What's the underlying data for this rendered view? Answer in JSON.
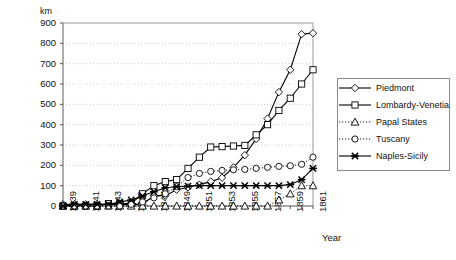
{
  "chart_data": {
    "type": "line",
    "title": "",
    "xlabel": "Year",
    "ylabel": "km",
    "ylim": [
      0,
      900
    ],
    "ytick_step": 100,
    "yticks": [
      "900",
      "800",
      "700",
      "600",
      "500",
      "400",
      "300",
      "200",
      "100",
      "0"
    ],
    "grid": true,
    "legend_position": "right-middle",
    "x": [
      1839,
      1840,
      1841,
      1842,
      1843,
      1844,
      1845,
      1846,
      1847,
      1848,
      1849,
      1850,
      1851,
      1852,
      1853,
      1854,
      1855,
      1856,
      1857,
      1858,
      1859,
      1860,
      1861
    ],
    "xtick_labels": [
      "1839",
      "1841",
      "1843",
      "1845",
      "1847",
      "1849",
      "1851",
      "1853",
      "1855",
      "1857",
      "1859",
      "1861"
    ],
    "series": [
      {
        "name": "Piedmont",
        "marker": "diamond",
        "linestyle": "solid",
        "values": [
          8,
          8,
          8,
          8,
          8,
          8,
          8,
          8,
          51,
          51,
          80,
          92,
          105,
          120,
          139,
          190,
          250,
          330,
          430,
          560,
          670,
          845,
          850
        ]
      },
      {
        "name": "Lombardy-Venetia",
        "marker": "square",
        "linestyle": "solid",
        "values": [
          0,
          0,
          0,
          0,
          12,
          12,
          12,
          60,
          100,
          120,
          130,
          185,
          240,
          290,
          292,
          295,
          298,
          350,
          400,
          470,
          530,
          600,
          670
        ]
      },
      {
        "name": "Papal States",
        "marker": "triangle",
        "linestyle": "dotted",
        "values": [
          0,
          0,
          0,
          0,
          0,
          0,
          0,
          0,
          0,
          0,
          0,
          0,
          0,
          0,
          0,
          0,
          0,
          0,
          0,
          30,
          60,
          100,
          100
        ]
      },
      {
        "name": "Tuscany",
        "marker": "circle",
        "linestyle": "dotted",
        "values": [
          0,
          0,
          0,
          0,
          0,
          0,
          8,
          20,
          40,
          60,
          95,
          140,
          160,
          170,
          175,
          178,
          180,
          185,
          190,
          195,
          198,
          205,
          240
        ]
      },
      {
        "name": "Naples-Sicily",
        "marker": "cross",
        "linestyle": "solid",
        "values": [
          0,
          8,
          8,
          8,
          8,
          20,
          30,
          50,
          70,
          90,
          95,
          98,
          100,
          100,
          100,
          100,
          100,
          100,
          100,
          100,
          105,
          130,
          185
        ]
      }
    ]
  },
  "legend": {
    "items": [
      {
        "label": "Piedmont"
      },
      {
        "label": "Lombardy-Venetia"
      },
      {
        "label": "Papal States"
      },
      {
        "label": "Tuscany"
      },
      {
        "label": "Naples-Sicily"
      }
    ]
  }
}
